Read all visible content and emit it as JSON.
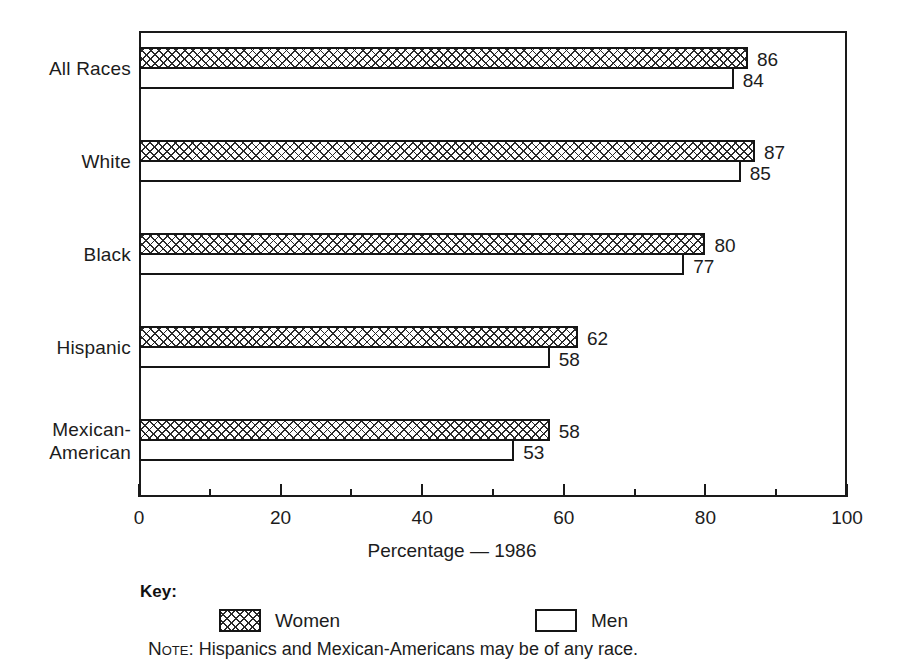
{
  "chart_data": {
    "type": "bar",
    "orientation": "horizontal",
    "title": "",
    "xlabel": "Percentage — 1986",
    "ylabel": "",
    "xlim": [
      0,
      100
    ],
    "xticks": [
      0,
      20,
      40,
      60,
      80,
      100
    ],
    "xtick_labels": [
      "0",
      "20",
      "40",
      "60",
      "80",
      "100"
    ],
    "minor_tick_interval": 10,
    "grid": false,
    "categories": [
      "All Races",
      "White",
      "Black",
      "Hispanic",
      "Mexican-American"
    ],
    "series": [
      {
        "name": "Women",
        "values": [
          86,
          87,
          80,
          62,
          58
        ],
        "fill": "crosshatch"
      },
      {
        "name": "Men",
        "values": [
          84,
          85,
          77,
          58,
          53
        ],
        "fill": "white"
      }
    ],
    "legend_position": "bottom",
    "annotations": [
      "Hispanics and Mexican-Americans may be of any race."
    ]
  },
  "axis": {
    "title": "Percentage — 1986",
    "ticks": [
      {
        "value": 0,
        "label": "0",
        "major": true
      },
      {
        "value": 10,
        "label": "",
        "major": false
      },
      {
        "value": 20,
        "label": "20",
        "major": true
      },
      {
        "value": 30,
        "label": "",
        "major": false
      },
      {
        "value": 40,
        "label": "40",
        "major": true
      },
      {
        "value": 50,
        "label": "",
        "major": false
      },
      {
        "value": 60,
        "label": "60",
        "major": true
      },
      {
        "value": 70,
        "label": "",
        "major": false
      },
      {
        "value": 80,
        "label": "80",
        "major": true
      },
      {
        "value": 90,
        "label": "",
        "major": false
      },
      {
        "value": 100,
        "label": "100",
        "major": true
      }
    ]
  },
  "groups": [
    {
      "label": "All Races",
      "women": 86,
      "men": 84,
      "women_label": "86",
      "men_label": "84"
    },
    {
      "label": "White",
      "women": 87,
      "men": 85,
      "women_label": "87",
      "men_label": "85"
    },
    {
      "label": "Black",
      "women": 80,
      "men": 77,
      "women_label": "80",
      "men_label": "77"
    },
    {
      "label": "Hispanic",
      "women": 62,
      "men": 58,
      "women_label": "62",
      "men_label": "58"
    },
    {
      "label": "Mexican-\nAmerican",
      "women": 58,
      "men": 53,
      "women_label": "58",
      "men_label": "53"
    }
  ],
  "legend": {
    "title": "Key:",
    "items": [
      {
        "label": "Women",
        "fill": "crosshatch"
      },
      {
        "label": "Men",
        "fill": "white"
      }
    ]
  },
  "note": {
    "keyword": "Note:",
    "text": "Hispanics and Mexican-Americans may be of any race."
  },
  "colors": {
    "ink": "#1a1a1a",
    "background": "#ffffff",
    "hatch": "#2a2a2a"
  }
}
